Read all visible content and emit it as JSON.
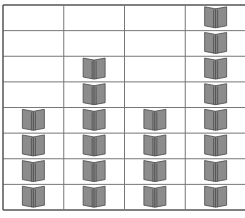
{
  "chart_data": {
    "type": "pictograph",
    "title": "",
    "icon": "book-icon",
    "categories": [
      "",
      "",
      "",
      ""
    ],
    "categories_note": "category labels are cut off at the bottom edge and not legible",
    "values": [
      4,
      6,
      4,
      8
    ],
    "max_rows": 8,
    "grid": true,
    "colors": {
      "grid_line": "#555555",
      "inner_grid_line": "#777777",
      "book_fill": "#8c8c8c",
      "book_stroke": "#4a4a4a"
    }
  }
}
